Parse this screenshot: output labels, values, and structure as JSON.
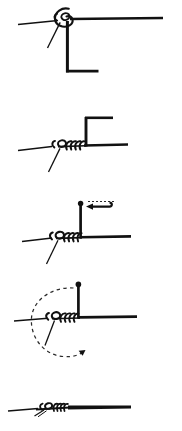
{
  "figure": {
    "title": "Knot tying sequence",
    "width": 182,
    "height": 431,
    "background_color": "#ffffff",
    "ink_color": "#111111",
    "dash_color": "#2b2b2b",
    "panel_count": 5,
    "orientation": "vertical stack"
  },
  "panels": [
    {
      "index": 1,
      "name": "step-1-initial-loop",
      "label": "",
      "description": "Standing line runs horizontally; a small overhand loop is formed near the left with a short tag end angling down-left, and the working end drops vertically then runs right along the bottom.",
      "elements": [
        "standing-line",
        "loop-coil",
        "tag-end",
        "working-end-vertical",
        "working-end-horizontal"
      ]
    },
    {
      "index": 2,
      "name": "step-2-wraps-made",
      "label": "",
      "description": "Several wraps have been coiled around the standing line; working end rises vertically and bends right at the top.",
      "elements": [
        "standing-line",
        "loop-coil",
        "wrap-coils",
        "tag-end",
        "working-end-vertical",
        "working-end-top-horizontal"
      ]
    },
    {
      "index": 3,
      "name": "step-3-pull-tag-end",
      "label": "",
      "description": "Working end stands vertically capped with a ball end; a dashed guide line and a solid arrow point left indicating the direction to pull.",
      "elements": [
        "standing-line",
        "loop-coil",
        "wrap-coils",
        "tag-end",
        "working-end-vertical",
        "ball-end",
        "direction-arrow-left",
        "dashed-guide"
      ]
    },
    {
      "index": 4,
      "name": "step-4-rotate-knot",
      "label": "",
      "description": "A large dashed circular arrow sweeps counter-clockwise around the knot, indicating the knot should be rotated or the end passed around.",
      "elements": [
        "standing-line",
        "loop-coil",
        "wrap-coils",
        "tag-end",
        "working-end-vertical",
        "ball-end",
        "dashed-rotation-arc",
        "rotation-arrowhead"
      ]
    },
    {
      "index": 5,
      "name": "step-5-knot-drawn-tight",
      "label": "",
      "description": "The completed knot drawn tight and seated on the line; wraps are compressed into a small neat cluster.",
      "elements": [
        "standing-line",
        "tightened-knot-cluster",
        "trimmed-tag-end"
      ]
    }
  ],
  "annotations": {
    "arrow_directions": {
      "step3": "left",
      "step4": "counter-clockwise"
    },
    "line_styles": {
      "rope": "solid",
      "motion_guide": "dashed"
    }
  }
}
